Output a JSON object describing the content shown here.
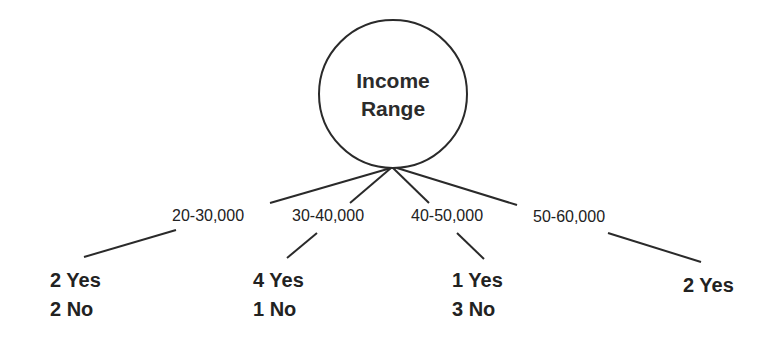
{
  "diagram": {
    "type": "decision-tree",
    "root": {
      "line1": "Income",
      "line2": "Range"
    },
    "branches": [
      {
        "label": "20-30,000",
        "yes": "2 Yes",
        "no": "2 No"
      },
      {
        "label": "30-40,000",
        "yes": "4 Yes",
        "no": "1 No"
      },
      {
        "label": "40-50,000",
        "yes": "1 Yes",
        "no": "3 No"
      },
      {
        "label": "50-60,000",
        "yes": "2 Yes",
        "no": ""
      }
    ],
    "colors": {
      "line": "#2a2a2a",
      "text": "#222222",
      "background": "#ffffff"
    }
  }
}
